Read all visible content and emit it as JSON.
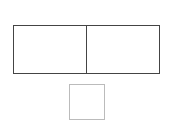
{
  "diagram": {
    "outer_box": {
      "cells": [
        {
          "label": ""
        },
        {
          "label": ""
        }
      ],
      "border_color": "#444444"
    },
    "small_square": {
      "label": "",
      "border_color": "#bbbbbb"
    }
  }
}
